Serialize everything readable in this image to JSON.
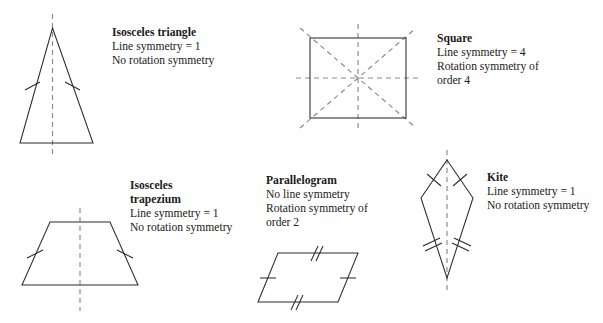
{
  "page": {
    "background_color": "#ffffff",
    "shape_stroke_color": "#2b2b2b",
    "symmetry_line_color": "#8a8a8a",
    "text_color": "#1a1a1a",
    "width": 603,
    "height": 323
  },
  "figures": [
    {
      "key": "isosceles-triangle",
      "title": "Isosceles triangle",
      "title_lines": [
        "Isosceles triangle"
      ],
      "line_symmetry_text": "Line symmetry = 1",
      "rotation_symmetry_text": "No rotation symmetry",
      "line_symmetry_count": 1,
      "rotation_symmetry_order": 0,
      "tick_marks": "single ticks on the two equal legs",
      "label_left": 112,
      "label_top": 26
    },
    {
      "key": "square",
      "title": "Square",
      "title_lines": [
        "Square"
      ],
      "line_symmetry_text": "Line symmetry = 4",
      "rotation_symmetry_text": "Rotation symmetry of",
      "rotation_symmetry_text_2": "order 4",
      "line_symmetry_count": 4,
      "rotation_symmetry_order": 4,
      "tick_marks": "none",
      "label_left": 437,
      "label_top": 32
    },
    {
      "key": "isosceles-trapezium",
      "title": "Isosceles trapezium",
      "title_lines": [
        "Isosceles",
        "trapezium"
      ],
      "line_symmetry_text": "Line symmetry = 1",
      "rotation_symmetry_text": "No rotation symmetry",
      "line_symmetry_count": 1,
      "rotation_symmetry_order": 0,
      "tick_marks": "single ticks on the two equal slanted legs",
      "label_left": 130,
      "label_top": 179
    },
    {
      "key": "parallelogram",
      "title": "Parallelogram",
      "title_lines": [
        "Parallelogram"
      ],
      "line_symmetry_text": "No line symmetry",
      "rotation_symmetry_text": "Rotation symmetry of",
      "rotation_symmetry_text_2": "order 2",
      "line_symmetry_count": 0,
      "rotation_symmetry_order": 2,
      "tick_marks": "double ticks on horizontal sides, single ticks on slanted sides",
      "label_left": 266,
      "label_top": 174
    },
    {
      "key": "kite",
      "title": "Kite",
      "title_lines": [
        "Kite"
      ],
      "line_symmetry_text": "Line symmetry = 1",
      "rotation_symmetry_text": "No rotation symmetry",
      "line_symmetry_count": 1,
      "rotation_symmetry_order": 0,
      "tick_marks": "single ticks on upper edges, double ticks on lower edges",
      "label_left": 487,
      "label_top": 171
    }
  ]
}
